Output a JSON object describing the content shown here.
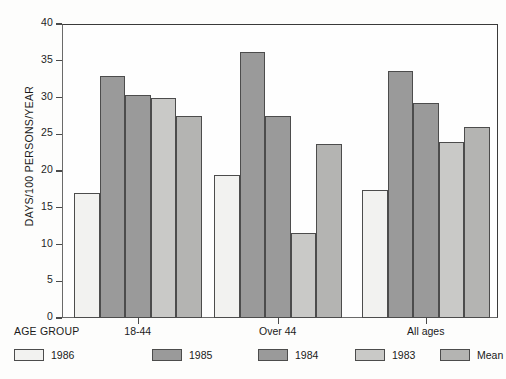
{
  "chart_data": {
    "type": "bar",
    "title": "",
    "subtitle": "",
    "xlabel": "AGE GROUP",
    "ylabel": "DAYS/100 PERSONS/YEAR",
    "categories": [
      "18-44",
      "Over 44",
      "All ages"
    ],
    "series": [
      {
        "name": "1986",
        "color": "#f2f2f0",
        "values": [
          17.0,
          19.4,
          17.4
        ]
      },
      {
        "name": "1985",
        "color": "#9a9a9a",
        "values": [
          32.9,
          36.2,
          33.6
        ]
      },
      {
        "name": "1984",
        "color": "#9a9a9a",
        "values": [
          30.4,
          27.5,
          29.3
        ]
      },
      {
        "name": "1983",
        "color": "#c9c9c7",
        "values": [
          29.9,
          11.6,
          23.9
        ]
      },
      {
        "name": "Mean",
        "color": "#b4b4b2",
        "values": [
          27.5,
          23.7,
          26.0
        ]
      }
    ],
    "ylim": [
      0,
      40
    ],
    "yticks": [
      0,
      5,
      10,
      15,
      20,
      25,
      30,
      35,
      40
    ],
    "ytick_labels": [
      "0",
      "5",
      "10",
      "15",
      "20",
      "25",
      "30",
      "35",
      "40"
    ],
    "grid": false,
    "legend_position": "bottom",
    "legend_entries": [
      "1986",
      "1985",
      "1984",
      "1983",
      "Mean"
    ],
    "axis_caption": "AGE GROUP"
  },
  "colors": {
    "axis": "#4a4a4a",
    "frame": "#3a3a3a",
    "bar_outline": "#4c4c4c",
    "background": "#fdfdfc",
    "text": "#1a1a1a"
  }
}
